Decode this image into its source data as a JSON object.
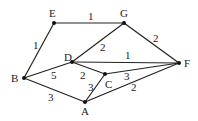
{
  "graph": {
    "nodes": [
      {
        "id": "E",
        "label": "E",
        "x": 54,
        "y": 23,
        "lx": 49,
        "ly": 17
      },
      {
        "id": "G",
        "label": "G",
        "x": 124,
        "y": 23,
        "lx": 120,
        "ly": 17
      },
      {
        "id": "D",
        "label": "D",
        "x": 72,
        "y": 62,
        "lx": 64,
        "ly": 61
      },
      {
        "id": "B",
        "label": "B",
        "x": 24,
        "y": 78,
        "lx": 11,
        "ly": 82
      },
      {
        "id": "C",
        "label": "C",
        "x": 105,
        "y": 74,
        "lx": 105,
        "ly": 88
      },
      {
        "id": "A",
        "label": "A",
        "x": 85,
        "y": 102,
        "lx": 81,
        "ly": 115
      },
      {
        "id": "F",
        "label": "F",
        "x": 179,
        "y": 63,
        "lx": 184,
        "ly": 67
      }
    ],
    "edges": [
      {
        "from": "E",
        "to": "G",
        "weight": "1",
        "lx": 88,
        "ly": 20
      },
      {
        "from": "E",
        "to": "B",
        "weight": "1",
        "lx": 33,
        "ly": 49
      },
      {
        "from": "G",
        "to": "D",
        "weight": "2",
        "lx": 100,
        "ly": 51
      },
      {
        "from": "G",
        "to": "F",
        "weight": "2",
        "lx": 153,
        "ly": 42
      },
      {
        "from": "D",
        "to": "F",
        "weight": "1",
        "lx": 125,
        "ly": 59
      },
      {
        "from": "D",
        "to": "B",
        "weight": "5",
        "lx": 51,
        "ly": 79
      },
      {
        "from": "D",
        "to": "C",
        "weight": "2",
        "lx": 80,
        "ly": 79
      },
      {
        "from": "C",
        "to": "A",
        "weight": "3",
        "lx": 88,
        "ly": 91
      },
      {
        "from": "C",
        "to": "F",
        "weight": "3",
        "lx": 124,
        "ly": 80
      },
      {
        "from": "A",
        "to": "F",
        "weight": "2",
        "lx": 131,
        "ly": 91
      },
      {
        "from": "B",
        "to": "A",
        "weight": "3",
        "lx": 48,
        "ly": 101
      }
    ]
  }
}
